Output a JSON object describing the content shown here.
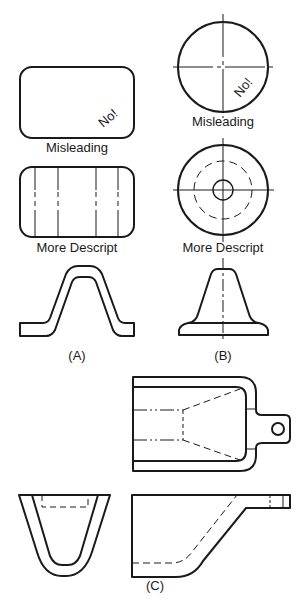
{
  "figure": {
    "section_a": {
      "misleading_view": {
        "annotation": "No!",
        "caption": "Misleading"
      },
      "descriptive_view": {
        "caption": "More  Descript"
      },
      "profile_label": "(A)"
    },
    "section_b": {
      "misleading_view": {
        "annotation": "No!",
        "caption": "Misleading"
      },
      "descriptive_view": {
        "caption": "More  Descript"
      },
      "profile_label": "(B)"
    },
    "section_c": {
      "views": [
        "top",
        "front",
        "side"
      ],
      "label": "(C)"
    }
  }
}
